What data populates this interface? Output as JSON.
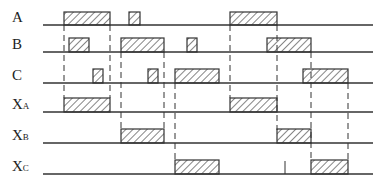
{
  "signals": [
    {
      "name": "A",
      "sub": "",
      "baseline": 25,
      "height": 13,
      "pulses": [
        [
          64,
          110
        ],
        [
          129,
          140
        ],
        [
          230,
          277
        ]
      ]
    },
    {
      "name": "B",
      "sub": "",
      "baseline": 52,
      "height": 14,
      "pulses": [
        [
          69,
          89
        ],
        [
          121,
          164
        ],
        [
          187,
          197
        ],
        [
          267,
          311
        ]
      ]
    },
    {
      "name": "C",
      "sub": "",
      "baseline": 83,
      "height": 14,
      "pulses": [
        [
          93,
          103
        ],
        [
          148,
          158
        ],
        [
          175,
          219
        ],
        [
          303,
          348
        ]
      ]
    },
    {
      "name": "X",
      "sub": "A",
      "baseline": 112,
      "height": 14,
      "pulses": [
        [
          64,
          110
        ],
        [
          230,
          277
        ]
      ]
    },
    {
      "name": "X",
      "sub": "B",
      "baseline": 143,
      "height": 14,
      "pulses": [
        [
          121,
          164
        ],
        [
          277,
          311
        ]
      ]
    },
    {
      "name": "X",
      "sub": "C",
      "baseline": 174,
      "height": 14,
      "pulses": [
        [
          175,
          219
        ],
        [
          311,
          348
        ]
      ]
    }
  ],
  "axis": {
    "x_start": 43,
    "x_end": 373
  },
  "dashed_lines": [
    {
      "x": 64,
      "y1": 25,
      "y2": 98
    },
    {
      "x": 110,
      "y1": 25,
      "y2": 98
    },
    {
      "x": 121,
      "y1": 52,
      "y2": 130
    },
    {
      "x": 164,
      "y1": 52,
      "y2": 130
    },
    {
      "x": 175,
      "y1": 83,
      "y2": 160
    },
    {
      "x": 230,
      "y1": 25,
      "y2": 98
    },
    {
      "x": 277,
      "y1": 25,
      "y2": 130
    },
    {
      "x": 311,
      "y1": 52,
      "y2": 160
    },
    {
      "x": 348,
      "y1": 83,
      "y2": 160
    }
  ],
  "tick_marks": [
    {
      "x": 285,
      "y1": 161,
      "y2": 174
    }
  ],
  "colors": {
    "line": "#333333",
    "hatch": "#333333"
  }
}
